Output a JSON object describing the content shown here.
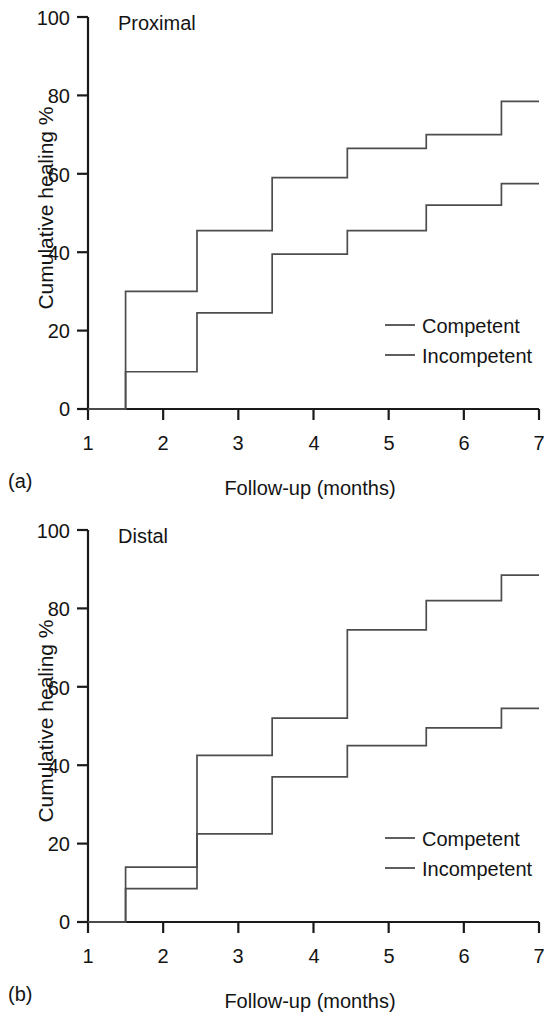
{
  "figure": {
    "background": "#ffffff",
    "line_color": "#4d4d4d",
    "axis_color": "#1a1a1a",
    "text_color": "#141414"
  },
  "panels": [
    {
      "tag": "(a)",
      "title": "Proximal",
      "xlabel": "Follow-up (months)",
      "ylabel": "Cumulative healing %",
      "yticks": [
        "0",
        "20",
        "40",
        "60",
        "80",
        "100"
      ],
      "xticks": [
        "1",
        "2",
        "3",
        "4",
        "5",
        "6",
        "7"
      ],
      "legend": [
        {
          "label": "Competent"
        },
        {
          "label": "Incompetent"
        }
      ]
    },
    {
      "tag": "(b)",
      "title": "Distal",
      "xlabel": "Follow-up (months)",
      "ylabel": "Cumulative healing %",
      "yticks": [
        "0",
        "20",
        "40",
        "60",
        "80",
        "100"
      ],
      "xticks": [
        "1",
        "2",
        "3",
        "4",
        "5",
        "6",
        "7"
      ],
      "legend": [
        {
          "label": "Competent"
        },
        {
          "label": "Incompetent"
        }
      ]
    }
  ],
  "chart_data": [
    {
      "type": "line",
      "subtype": "step",
      "panel": "(a)",
      "title": "Proximal",
      "xlabel": "Follow-up (months)",
      "ylabel": "Cumulative healing %",
      "xlim": [
        1,
        7
      ],
      "ylim": [
        0,
        100
      ],
      "xticks": [
        1,
        2,
        3,
        4,
        5,
        6,
        7
      ],
      "yticks": [
        0,
        20,
        40,
        60,
        80,
        100
      ],
      "grid": false,
      "legend_position": "lower-right",
      "x": [
        1,
        1.5,
        2.45,
        3.45,
        4.45,
        5.5,
        6.5,
        7
      ],
      "series": [
        {
          "name": "Competent",
          "values": [
            0,
            30,
            45.5,
            59,
            66.5,
            70,
            78.5,
            78.5
          ]
        },
        {
          "name": "Incompetent",
          "values": [
            0,
            9.5,
            24.5,
            39.5,
            45.5,
            52,
            57.5,
            57.5
          ]
        }
      ]
    },
    {
      "type": "line",
      "subtype": "step",
      "panel": "(b)",
      "title": "Distal",
      "xlabel": "Follow-up (months)",
      "ylabel": "Cumulative healing %",
      "xlim": [
        1,
        7
      ],
      "ylim": [
        0,
        100
      ],
      "xticks": [
        1,
        2,
        3,
        4,
        5,
        6,
        7
      ],
      "yticks": [
        0,
        20,
        40,
        60,
        80,
        100
      ],
      "grid": false,
      "legend_position": "lower-right",
      "x": [
        1,
        1.5,
        2.45,
        3.45,
        4.45,
        5.5,
        6.5,
        7
      ],
      "series": [
        {
          "name": "Competent",
          "values": [
            0,
            14,
            42.5,
            52,
            74.5,
            82,
            88.5,
            88.5
          ]
        },
        {
          "name": "Incompetent",
          "values": [
            0,
            8.5,
            22.5,
            37,
            45,
            49.5,
            54.5,
            54.5
          ]
        }
      ]
    }
  ]
}
